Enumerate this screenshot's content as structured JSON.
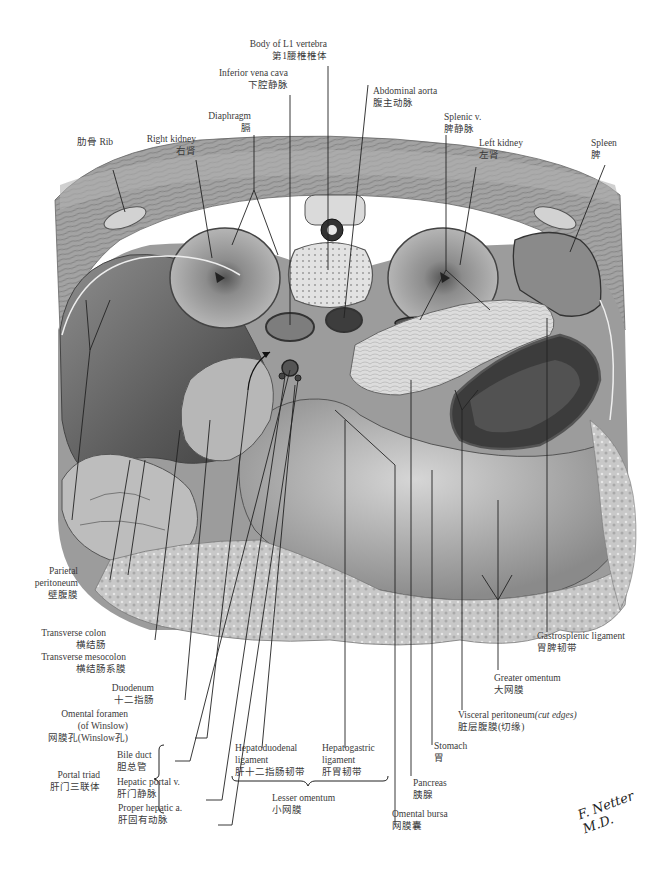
{
  "figure": {
    "type": "anatomical cross-section illustration",
    "view": "transverse section at L1 level showing omental bursa",
    "signature": "F. Netter M.D."
  },
  "labels": {
    "body_l1": {
      "en": "Body of L1 vertebra",
      "zh": "第1腰椎椎体"
    },
    "ivc": {
      "en": "Inferior vena cava",
      "zh": "下腔静脉"
    },
    "aorta": {
      "en": "Abdominal aorta",
      "zh": "腹主动脉"
    },
    "diaphragm": {
      "en": "Diaphragm",
      "zh": "膈"
    },
    "rib": {
      "en": "肋骨 Rib"
    },
    "right_kidney": {
      "en": "Right kidney",
      "zh": "右肾"
    },
    "splenic_v": {
      "en": "Splenic v.",
      "zh": "脾静脉"
    },
    "left_kidney": {
      "en": "Left kidney",
      "zh": "左肾"
    },
    "spleen": {
      "en": "Spleen",
      "zh": "脾"
    },
    "parietal_peritoneum": {
      "en1": "Parietal",
      "en2": "peritoneum",
      "zh": "壁腹膜"
    },
    "transverse_colon": {
      "en": "Transverse colon",
      "zh": "横结肠"
    },
    "transverse_mesocolon": {
      "en": "Transverse mesocolon",
      "zh": "横结肠系膜"
    },
    "duodenum": {
      "en": "Duodenum",
      "zh": "十二指肠"
    },
    "omental_foramen": {
      "en1": "Omental foramen",
      "en2": "(of Winslow)",
      "zh": "网膜孔(Winslow孔)"
    },
    "portal_triad": {
      "en": "Portal triad",
      "zh": "肝门三联体"
    },
    "bile_duct": {
      "en": "Bile duct",
      "zh": "胆总管"
    },
    "hepatic_portal_v": {
      "en": "Hepatic portal v.",
      "zh": "肝门静脉"
    },
    "proper_hepatic_a": {
      "en": "Proper hepatic a.",
      "zh": "肝固有动脉"
    },
    "hepatoduodenal_lig": {
      "en1": "Hepatoduodenal",
      "en2": "ligament",
      "zh": "肝十二指肠韧带"
    },
    "hepatogastric_lig": {
      "en1": "Hepatogastric",
      "en2": "ligament",
      "zh": "肝胃韧带"
    },
    "lesser_omentum": {
      "en": "Lesser omentum",
      "zh": "小网膜"
    },
    "omental_bursa": {
      "en": "Omental bursa",
      "zh": "网膜囊"
    },
    "pancreas": {
      "en": "Pancreas",
      "zh": "胰腺"
    },
    "stomach": {
      "en": "Stomach",
      "zh": "胃"
    },
    "visceral_peritoneum": {
      "en": "Visceral peritoneum",
      "en_italic": "(cut edges)",
      "zh": "脏层腹膜(切缘)"
    },
    "greater_omentum": {
      "en": "Greater omentum",
      "zh": "大网膜"
    },
    "gastrosplenic_lig": {
      "en": "Gastrosplenic ligament",
      "zh": "胃脾韧带"
    }
  },
  "colors": {
    "muscle": "#9a9a9a",
    "organ_dark": "#6e6e6e",
    "organ_mid": "#a8a8a8",
    "organ_light": "#d0d0d0",
    "omentum": "#c4c4c4",
    "line": "#222222",
    "text": "#3a3a3a"
  }
}
